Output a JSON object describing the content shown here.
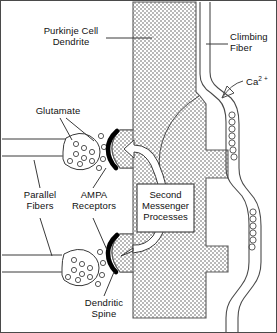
{
  "figure": {
    "labels": {
      "purkinje": "Purkinje Cell\nDendrite",
      "climbing_fiber": "Climbing\nFiber",
      "calcium": "Ca",
      "calcium_sup": "2 +",
      "glutamate": "Glutamate",
      "parallel_fibers": "Parallel\nFibers",
      "ampa": "AMPA\nReceptors",
      "dendritic_spine": "Dendritic\nSpine",
      "second_messenger": "Second\nMessenger\nProcesses"
    },
    "box_lines": [
      "Second",
      "Messenger",
      "Processes"
    ],
    "colors": {
      "ink": "#111111",
      "stipple_dark": "#9a9a9a",
      "stipple_light": "#e8e8e8",
      "psd_black": "#000000",
      "background": "#ffffff",
      "frame": "#3a3a3a"
    },
    "structures": [
      "purkinje-cell-dendrite",
      "climbing-fiber",
      "parallel-fiber-upper",
      "parallel-fiber-lower",
      "presynaptic-bouton-upper",
      "presynaptic-bouton-lower",
      "dendritic-spine-upper",
      "dendritic-spine-lower",
      "second-messenger-box",
      "calcium-vesicles"
    ]
  }
}
